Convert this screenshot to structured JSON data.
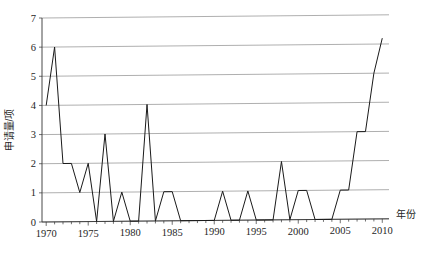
{
  "chart_data": {
    "type": "line",
    "title": "",
    "xlabel": "年份",
    "ylabel": "申请量/项",
    "xlim": [
      1969.5,
      2010.8
    ],
    "ylim": [
      0,
      7
    ],
    "grid": true,
    "legend": false,
    "x": [
      1970,
      1971,
      1972,
      1973,
      1974,
      1975,
      1976,
      1977,
      1978,
      1979,
      1980,
      1981,
      1982,
      1983,
      1984,
      1985,
      1986,
      1987,
      1988,
      1989,
      1990,
      1991,
      1992,
      1993,
      1994,
      1995,
      1996,
      1997,
      1998,
      1999,
      2000,
      2001,
      2002,
      2003,
      2004,
      2005,
      2006,
      2007,
      2008,
      2009,
      2010
    ],
    "values": [
      4,
      6,
      2,
      2,
      1,
      2,
      0,
      3,
      0,
      1,
      0,
      0,
      4,
      0,
      1,
      1,
      0,
      0,
      0,
      0,
      0,
      1,
      0,
      0,
      1,
      0,
      0,
      0,
      2,
      0,
      1,
      1,
      0,
      0,
      0,
      1,
      1,
      3,
      3,
      5,
      6.2
    ],
    "series": [
      {
        "name": "申请量/项",
        "values": [
          4,
          6,
          2,
          2,
          1,
          2,
          0,
          3,
          0,
          1,
          0,
          0,
          4,
          0,
          1,
          1,
          0,
          0,
          0,
          0,
          0,
          1,
          0,
          0,
          1,
          0,
          0,
          0,
          2,
          0,
          1,
          1,
          0,
          0,
          0,
          1,
          1,
          3,
          3,
          5,
          6.2
        ],
        "color": "#1a1a1a"
      }
    ],
    "y_ticks": [
      0,
      1,
      2,
      3,
      4,
      5,
      6,
      7
    ],
    "y_tick_labels": [
      "0",
      "1",
      "2",
      "3",
      "4",
      "5",
      "6",
      "7"
    ],
    "x_ticks": [
      1970,
      1975,
      1980,
      1985,
      1990,
      1995,
      2000,
      2005,
      2010
    ],
    "x_tick_labels": [
      "1970",
      "1975",
      "1980",
      "1985",
      "1990",
      "1995",
      "2000",
      "2005",
      "2010"
    ],
    "x_minor_step": 1,
    "colors": {
      "line": "#1a1a1a",
      "grid": "#8c8c8c",
      "axis": "#333333",
      "text": "#262626",
      "background": "#ffffff"
    }
  }
}
